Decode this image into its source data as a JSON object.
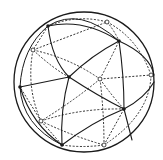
{
  "diagram": {
    "colors": {
      "stroke": "#1a1a1a",
      "background": "#ffffff"
    },
    "sphere": {
      "cx": 84,
      "cy": 82,
      "r": 70
    },
    "front_vertices": [
      {
        "id": "f1",
        "x": 48,
        "y": 26
      },
      {
        "id": "f2",
        "x": 119,
        "y": 41
      },
      {
        "id": "f3",
        "x": 69,
        "y": 77
      },
      {
        "id": "f4",
        "x": 20,
        "y": 87
      },
      {
        "id": "f5",
        "x": 124,
        "y": 109
      },
      {
        "id": "f6",
        "x": 62,
        "y": 145
      }
    ],
    "back_vertices": [
      {
        "id": "b1",
        "x": 107,
        "y": 22
      },
      {
        "id": "b2",
        "x": 33,
        "y": 50
      },
      {
        "id": "b3",
        "x": 100,
        "y": 79
      },
      {
        "id": "b4",
        "x": 151,
        "y": 75
      },
      {
        "id": "b5",
        "x": 41,
        "y": 121
      },
      {
        "id": "b6",
        "x": 104,
        "y": 145
      }
    ],
    "legend": {
      "solid": "visible (front) edges",
      "dashed": "hidden (back) edges",
      "filled_dot": "front vertex",
      "open_dot": "back vertex"
    }
  }
}
